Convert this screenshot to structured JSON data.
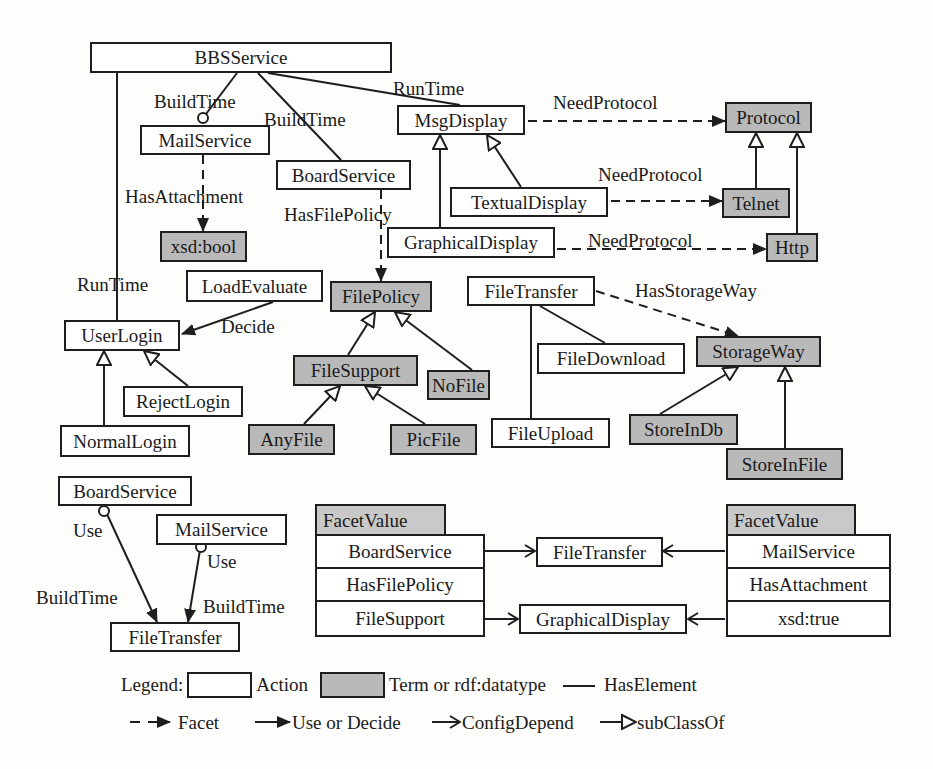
{
  "colors": {
    "action_fill": "#ffffff",
    "term_fill": "#b9b9b9",
    "stroke": "#1e1e1e",
    "facet_header_fill": "#c9c9c9"
  },
  "nodes": {
    "bbsservice": {
      "label": "BBSService",
      "kind": "action"
    },
    "mailservice": {
      "label": "MailService",
      "kind": "action"
    },
    "boardservice": {
      "label": "BoardService",
      "kind": "action"
    },
    "msgdisplay": {
      "label": "MsgDisplay",
      "kind": "action"
    },
    "protocol": {
      "label": "Protocol",
      "kind": "term"
    },
    "textualdisplay": {
      "label": "TextualDisplay",
      "kind": "action"
    },
    "telnet": {
      "label": "Telnet",
      "kind": "term"
    },
    "graphicaldisplay": {
      "label": "GraphicalDisplay",
      "kind": "action"
    },
    "http": {
      "label": "Http",
      "kind": "term"
    },
    "xsdbool": {
      "label": "xsd:bool",
      "kind": "term"
    },
    "loadevaluate": {
      "label": "LoadEvaluate",
      "kind": "action"
    },
    "userlogin": {
      "label": "UserLogin",
      "kind": "action"
    },
    "rejectlogin": {
      "label": "RejectLogin",
      "kind": "action"
    },
    "normallogin": {
      "label": "NormalLogin",
      "kind": "action"
    },
    "filepolicy": {
      "label": "FilePolicy",
      "kind": "term"
    },
    "filesupport": {
      "label": "FileSupport",
      "kind": "term"
    },
    "nofile": {
      "label": "NoFile",
      "kind": "term"
    },
    "anyfile": {
      "label": "AnyFile",
      "kind": "term"
    },
    "picfile": {
      "label": "PicFile",
      "kind": "term"
    },
    "filetransfer": {
      "label": "FileTransfer",
      "kind": "action"
    },
    "filedownload": {
      "label": "FileDownload",
      "kind": "action"
    },
    "fileupload": {
      "label": "FileUpload",
      "kind": "action"
    },
    "storageway": {
      "label": "StorageWay",
      "kind": "term"
    },
    "storeindb": {
      "label": "StoreInDb",
      "kind": "term"
    },
    "storeinfile": {
      "label": "StoreInFile",
      "kind": "term"
    },
    "use_boardservice": {
      "label": "BoardService",
      "kind": "action"
    },
    "use_mailservice": {
      "label": "MailService",
      "kind": "action"
    },
    "use_filetransfer": {
      "label": "FileTransfer",
      "kind": "action"
    },
    "cfg_filetransfer": {
      "label": "FileTransfer",
      "kind": "action"
    },
    "cfg_graphicaldisplay": {
      "label": "GraphicalDisplay",
      "kind": "action"
    }
  },
  "edge_labels": {
    "buildtime_mail": "BuildTime",
    "buildtime_board": "BuildTime",
    "runtime_msg": "RunTime",
    "runtime_login": "RunTime",
    "needprotocol_1": "NeedProtocol",
    "needprotocol_2": "NeedProtocol",
    "needprotocol_3": "NeedProtocol",
    "hasattachment": "HasAttachment",
    "hasfilepolicy": "HasFilePolicy",
    "decide": "Decide",
    "hasstorageway": "HasStorageWay",
    "use_1": "Use",
    "use_2": "Use",
    "buildtime_use_1": "BuildTime",
    "buildtime_use_2": "BuildTime"
  },
  "facet_tables": [
    {
      "header": "FacetValue",
      "rows": [
        "BoardService",
        "HasFilePolicy",
        "FileSupport"
      ]
    },
    {
      "header": "FacetValue",
      "rows": [
        "MailService",
        "HasAttachment",
        "xsd:true"
      ]
    }
  ],
  "legend": {
    "title": "Legend:",
    "action": "Action",
    "term": "Term or rdf:datatype",
    "has_element": "HasElement",
    "facet": "Facet",
    "use_or_decide": "Use or Decide",
    "config_depend": "ConfigDepend",
    "subclass_of": "subClassOf"
  }
}
